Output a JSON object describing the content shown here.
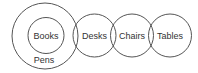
{
  "diagram": {
    "type": "euler",
    "stroke_color": "#555555",
    "text_color": "#333333",
    "sets": [
      {
        "id": "pens",
        "label": "Pens",
        "cx": 45,
        "cy": 36,
        "r": 33,
        "label_x": 44,
        "label_y": 63
      },
      {
        "id": "books",
        "label": "Books",
        "cx": 46,
        "cy": 35.5,
        "r": 18,
        "label_x": 46,
        "label_y": 38.5,
        "contained_in": "pens"
      },
      {
        "id": "desks",
        "label": "Desks",
        "cx": 94.5,
        "cy": 35.5,
        "r": 21.5,
        "label_x": 94.5,
        "label_y": 38.5
      },
      {
        "id": "chairs",
        "label": "Chairs",
        "cx": 132,
        "cy": 35.5,
        "r": 21.5,
        "label_x": 132,
        "label_y": 38.5
      },
      {
        "id": "tables",
        "label": "Tables",
        "cx": 170,
        "cy": 35.5,
        "r": 21.5,
        "label_x": 170,
        "label_y": 38.5
      }
    ]
  }
}
